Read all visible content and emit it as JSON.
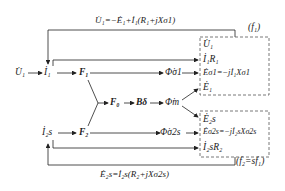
{
  "top_equation": "U̇₁=−Ė₁+İ₁(R₁+jXσ1)",
  "bottom_equation": "Ė₂s=İ₂s(R₂+jXσ2s)",
  "freq_stator": "(f₁)",
  "freq_rotor": "(f₂=sf₁)",
  "nodes": {
    "u1_input": "U̇₁",
    "i1": "İ₁",
    "f1": "F₁",
    "phi_sigma1": "Φ̇σ1",
    "f0": "F₀",
    "b_delta": "Bδ",
    "phi_m": "Φ̇m",
    "i2s": "İ₂s",
    "f2": "F₂",
    "phi_sigma2s": "Φ̇σ2s"
  },
  "stator_box": [
    "U̇₁",
    "İ₁R₁",
    "Ėσ1=−jİ₁Xσ1",
    "Ė₁"
  ],
  "rotor_box": [
    "Ė₂s",
    "Ėσ2s=−jİ₂sXσ2s",
    "İ₂sR₂"
  ],
  "colors": {
    "line": "#222222",
    "dashed_box": "#555555"
  }
}
